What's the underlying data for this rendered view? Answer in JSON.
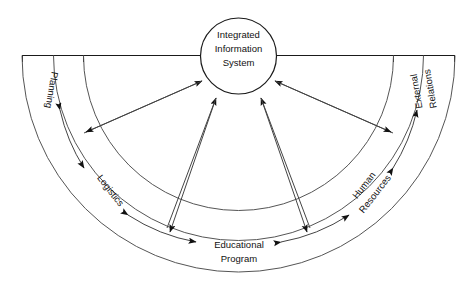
{
  "diagram": {
    "title_hub": {
      "lines": [
        "Integrated",
        "Information",
        "System"
      ],
      "line1": "Integrated",
      "line2": "Information",
      "line3": "System"
    },
    "sectors": [
      {
        "id": "planning",
        "label": "Planning",
        "lines": [
          "Planning"
        ],
        "line1": "Planning",
        "line2": "",
        "angle_deg": 180,
        "text_rotation_deg": 100
      },
      {
        "id": "logistics",
        "label": "Logistics",
        "lines": [
          "Logistics"
        ],
        "line1": "Logistics",
        "line2": "",
        "angle_deg": 144,
        "text_rotation_deg": 52
      },
      {
        "id": "educational-program",
        "label": "Educational Program",
        "lines": [
          "Educational",
          "Program"
        ],
        "line1": "Educational",
        "line2": "Program",
        "angle_deg": 90,
        "text_rotation_deg": 0
      },
      {
        "id": "human-resources",
        "label": "Human Resources",
        "lines": [
          "Human",
          "Resources"
        ],
        "line1": "Human",
        "line2": "Resources",
        "angle_deg": 36,
        "text_rotation_deg": -52
      },
      {
        "id": "external-relations",
        "label": "External Relations",
        "lines": [
          "External",
          "Relations"
        ],
        "line1": "External",
        "line2": "Relations",
        "angle_deg": 0,
        "text_rotation_deg": -100
      }
    ],
    "colors": {
      "stroke": "#1a1a1a",
      "arc": "#555555",
      "background": "#ffffff",
      "arrow": "#111111"
    }
  }
}
